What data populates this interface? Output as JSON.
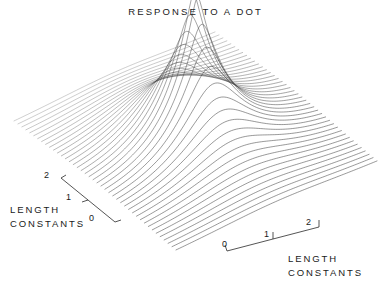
{
  "figure": {
    "title": "RESPONSE TO A DOT",
    "background_color": "#ffffff",
    "line_color": "#3a3a3a",
    "width": 389,
    "height": 288
  },
  "axes": {
    "left": {
      "label_line1": "LENGTH",
      "label_line2": "CONSTANTS",
      "ticks": [
        "2",
        "1",
        "0"
      ]
    },
    "right": {
      "label_line1": "LENGTH",
      "label_line2": "CONSTANTS",
      "ticks": [
        "0",
        "1",
        "2"
      ]
    }
  },
  "chart_data": {
    "type": "line",
    "title": "RESPONSE TO A DOT",
    "subtitle": "",
    "render_style": "3d-wireframe-surface-profile-lines",
    "xlabel": "LENGTH CONSTANTS",
    "ylabel": "LENGTH CONSTANTS",
    "zlabel": "",
    "xlim": [
      0,
      2.6
    ],
    "ylim": [
      0,
      2.6
    ],
    "zlim": [
      0,
      1
    ],
    "xticks": [
      0,
      1,
      2
    ],
    "yticks": [
      0,
      1,
      2
    ],
    "xticklabels": [
      "0",
      "1",
      "2"
    ],
    "yticklabels": [
      "0",
      "1",
      "2"
    ],
    "grid": false,
    "legend": null,
    "legend_position": "none",
    "annotations": [],
    "surface": {
      "description": "Sharp central impulse-response peak decaying to a flat plane in all directions",
      "peak_center_x": 1.3,
      "peak_center_y": 1.3,
      "peak_height": 1.0,
      "decay_length_constant": 0.32,
      "baseline": 0.0,
      "profile_line_count": 42,
      "samples_per_profile": 120
    },
    "projection": {
      "apex_px": [
        193,
        30
      ],
      "left_corner_px": [
        14,
        122
      ],
      "right_corner_px": [
        377,
        162
      ],
      "front_corner_px": [
        176,
        251
      ],
      "back_corner_px": [
        196,
        84
      ]
    }
  }
}
